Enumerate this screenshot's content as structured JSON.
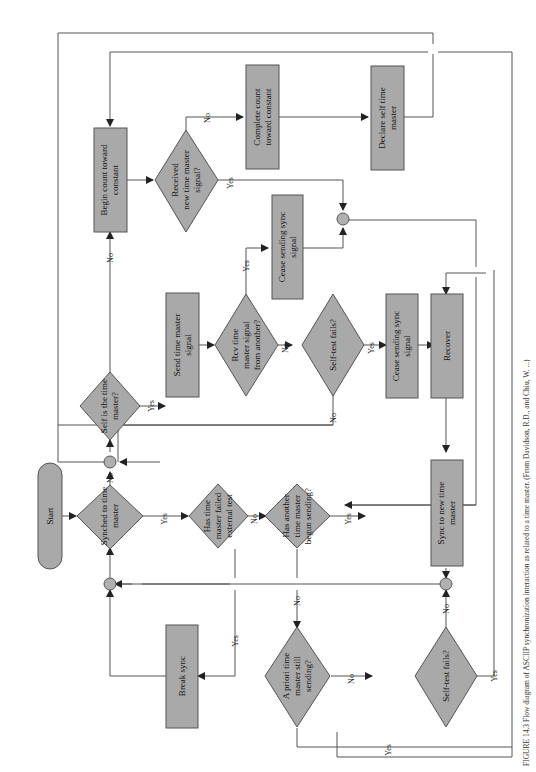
{
  "figure": {
    "caption": "FIGURE 14.3   Flow diagram of ASCIIP synchronization interaction as related to a time master. (From Davidson, R.D., and Chiu, W. ...)",
    "orientation": "rotated 90° counter-clockwise"
  },
  "nodes": {
    "start": "Start",
    "synched": [
      "Synched to time",
      "master"
    ],
    "self_master": [
      "Self is the time",
      "master?"
    ],
    "send_signal": [
      "Send time master",
      "signal"
    ],
    "rcv_signal": [
      "Rcv time",
      "master signal",
      "from another?"
    ],
    "self_test_1": [
      "Self-test fails?"
    ],
    "cease_sync_1": [
      "Cease sending sync",
      "signal"
    ],
    "cease_sync_2": [
      "Cease sending sync",
      "signal"
    ],
    "recover": [
      "Recover"
    ],
    "begin_count": [
      "Begin count toward",
      "constant"
    ],
    "received_new": [
      "Received",
      "new time master",
      "signal?"
    ],
    "complete_count": [
      "Complete count",
      "toward constant"
    ],
    "declare_self": [
      "Declare self time",
      "master"
    ],
    "failed_external": [
      "Has time",
      "master failed",
      "external test"
    ],
    "another_begun": [
      "Has another",
      "time master",
      "begun sending?"
    ],
    "sync_new": [
      "Sync to new time",
      "master"
    ],
    "break_sync": [
      "Break sync"
    ],
    "a_priori": [
      "A priori time",
      "master still",
      "sending?"
    ],
    "self_test_2": [
      "Self-test fails?"
    ]
  },
  "edge_labels": {
    "yes": "Yes",
    "no": "No"
  }
}
